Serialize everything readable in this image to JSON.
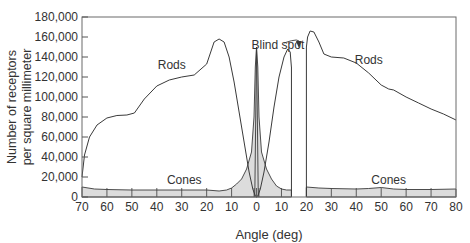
{
  "chart_data": {
    "type": "area",
    "title": "",
    "xlabel": "Angle (deg)",
    "ylabel_line1": "Number of receptors",
    "ylabel_line2": "per square millimeter",
    "ylim": [
      0,
      180000
    ],
    "xlim_display": [
      "70 (temporal)",
      "80 (nasal)"
    ],
    "x_tick_labels": [
      "70",
      "60",
      "50",
      "40",
      "30",
      "20",
      "10",
      "0",
      "10",
      "20",
      "30",
      "40",
      "50",
      "60",
      "70",
      "80"
    ],
    "x_tick_positions": [
      -70,
      -60,
      -50,
      -40,
      -30,
      -20,
      -10,
      0,
      10,
      20,
      30,
      40,
      50,
      60,
      70,
      80
    ],
    "y_tick_labels": [
      "0",
      "20,000",
      "40,000",
      "60,000",
      "80,000",
      "100,000",
      "120,000",
      "140,000",
      "160,000",
      "180,000"
    ],
    "y_tick_values": [
      0,
      20000,
      40000,
      60000,
      80000,
      100000,
      120000,
      140000,
      160000,
      180000
    ],
    "grid": false,
    "legend": "none (inline labels)",
    "series": [
      {
        "name": "Rods",
        "style": "line",
        "x": [
          -70,
          -69,
          -67,
          -64,
          -60,
          -56,
          -52,
          -49,
          -45,
          -40,
          -35,
          -30,
          -25,
          -20,
          -17,
          -15,
          -13,
          -11,
          -9,
          -7,
          -5,
          -3,
          -1.5,
          -0.5,
          0,
          0.5,
          1.5,
          3,
          5,
          7,
          9,
          11,
          12.5,
          13.5,
          14
        ],
        "values": [
          20000,
          42000,
          60000,
          72000,
          79000,
          81500,
          82000,
          84000,
          98000,
          111000,
          117000,
          120000,
          122000,
          133000,
          155000,
          158000,
          155000,
          140000,
          115000,
          85000,
          55000,
          25000,
          8000,
          1000,
          0,
          1000,
          8000,
          25000,
          55000,
          90000,
          120000,
          140000,
          148000,
          145000,
          130000
        ]
      },
      {
        "name": "Rods (nasal, after blind spot)",
        "style": "line",
        "x": [
          20,
          20.5,
          21.5,
          23,
          25,
          27,
          30,
          35,
          40,
          45,
          50,
          53,
          55,
          60,
          65,
          70,
          75,
          80
        ],
        "values": [
          150000,
          160000,
          166000,
          165000,
          155000,
          143000,
          140000,
          139000,
          134000,
          124000,
          112000,
          108000,
          107000,
          100000,
          94000,
          88000,
          83000,
          77000
        ]
      },
      {
        "name": "Cones",
        "style": "filled",
        "x": [
          -70,
          -65,
          -60,
          -50,
          -40,
          -30,
          -20,
          -15,
          -12,
          -10,
          -8,
          -6,
          -4,
          -2,
          -1,
          -0.5,
          0,
          0.5,
          1,
          2,
          4,
          6,
          8,
          10,
          12,
          14,
          20,
          25,
          30,
          40,
          45,
          50,
          55,
          60,
          70,
          80
        ],
        "values": [
          10000,
          8000,
          7500,
          7000,
          7000,
          7000,
          7000,
          6000,
          7000,
          9000,
          13000,
          18000,
          28000,
          45000,
          80000,
          130000,
          150000,
          130000,
          80000,
          45000,
          28000,
          18000,
          11000,
          8000,
          7000,
          7000,
          10000,
          9000,
          8500,
          8000,
          8500,
          9500,
          8000,
          7500,
          7500,
          8000
        ]
      }
    ],
    "annotations": [
      {
        "text": "Rods",
        "at_x": -34,
        "at_y": 128000
      },
      {
        "text": "Rods",
        "at_x": 45,
        "at_y": 133000
      },
      {
        "text": "Cones",
        "at_x": -29,
        "at_y": 13000
      },
      {
        "text": "Cones",
        "at_x": 53,
        "at_y": 13000
      },
      {
        "text": "Blind spot",
        "arrow_to_x": 17,
        "arrow_to_y": 150000,
        "blind_spot_range_deg": [
          14,
          20
        ]
      }
    ]
  }
}
